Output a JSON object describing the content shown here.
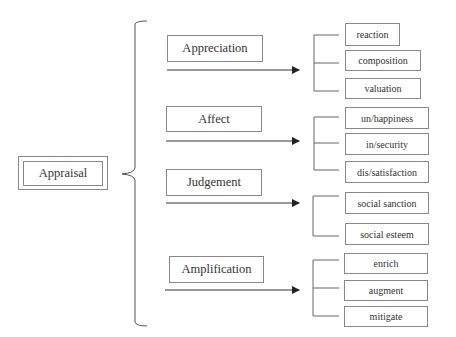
{
  "diagram": {
    "root": {
      "label": "Appraisal"
    },
    "categories": [
      {
        "label": "Appreciation",
        "children": [
          "reaction",
          "composition",
          "valuation"
        ]
      },
      {
        "label": "Affect",
        "children": [
          "un/happiness",
          "in/security",
          "dis/satisfaction"
        ]
      },
      {
        "label": "Judgement",
        "children": [
          "social sanction",
          "social esteem"
        ]
      },
      {
        "label": "Amplification",
        "children": [
          "enrich",
          "augment",
          "mitigate"
        ]
      }
    ],
    "colors": {
      "line": "#555555",
      "border": "#888888",
      "text": "#333333",
      "background": "#ffffff"
    }
  }
}
